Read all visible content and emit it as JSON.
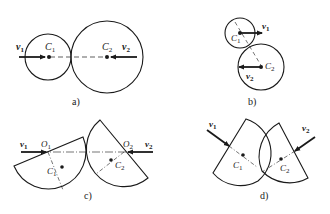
{
  "figures": [
    {
      "id": "a",
      "caption": "a)",
      "labels": {
        "v1": "v",
        "v1_sub": "1",
        "v2": "v",
        "v2_sub": "2",
        "c1": "C",
        "c1_sub": "1",
        "c2": "C",
        "c2_sub": "2"
      }
    },
    {
      "id": "b",
      "caption": "b)",
      "labels": {
        "v1": "v",
        "v1_sub": "1",
        "v2": "v",
        "v2_sub": "2",
        "c1": "C",
        "c1_sub": "1",
        "c2": "C",
        "c2_sub": "2"
      }
    },
    {
      "id": "c",
      "caption": "c)",
      "labels": {
        "v1": "v",
        "v1_sub": "1",
        "v2": "v",
        "v2_sub": "2",
        "o1": "O",
        "o1_sub": "1",
        "o2": "O",
        "o2_sub": "2",
        "c1": "C",
        "c1_sub": "1",
        "c2": "C",
        "c2_sub": "2"
      }
    },
    {
      "id": "d",
      "caption": "d)",
      "labels": {
        "v1": "v",
        "v1_sub": "1",
        "v2": "v",
        "v2_sub": "2",
        "c1": "C",
        "c1_sub": "1",
        "c2": "C",
        "c2_sub": "2"
      }
    }
  ],
  "colors": {
    "stroke": "#1a1a1a",
    "background": "#ffffff"
  }
}
